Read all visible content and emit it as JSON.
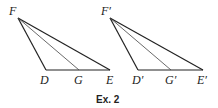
{
  "caption": "Ex. 2",
  "colors": {
    "stroke": "#222222",
    "background": "#ffffff"
  },
  "figures": [
    {
      "name": "triangle-DEF",
      "points": {
        "F": {
          "label": "F",
          "x": 18,
          "y": 18
        },
        "D": {
          "label": "D",
          "x": 46,
          "y": 70
        },
        "G": {
          "label": "G",
          "x": 79,
          "y": 70
        },
        "E": {
          "label": "E",
          "x": 110,
          "y": 70
        }
      },
      "segments": [
        "FD",
        "FE",
        "DE",
        "FG"
      ]
    },
    {
      "name": "triangle-D'E'F'",
      "points": {
        "F": {
          "label": "F′",
          "x": 110,
          "y": 18
        },
        "D": {
          "label": "D′",
          "x": 138,
          "y": 70
        },
        "G": {
          "label": "G′",
          "x": 171,
          "y": 70
        },
        "E": {
          "label": "E′",
          "x": 203,
          "y": 70
        }
      },
      "segments": [
        "F′D′",
        "F′E′",
        "D′E′",
        "F′G′"
      ]
    }
  ]
}
